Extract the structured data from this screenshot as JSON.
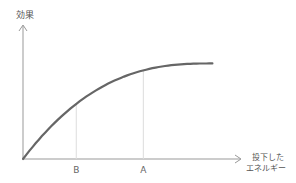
{
  "chart_data": {
    "type": "line",
    "title": "",
    "ylabel": "効果",
    "xlabel_lines": [
      "投下した",
      "エネルギー"
    ],
    "markers": [
      {
        "label": "B",
        "x": 0.27
      },
      {
        "label": "A",
        "x": 0.61
      }
    ],
    "curve": {
      "description": "diminishing returns (concave, saturating)",
      "points": [
        [
          0,
          0
        ],
        [
          0.05,
          0.3
        ],
        [
          0.15,
          0.55
        ],
        [
          0.27,
          0.72
        ],
        [
          0.45,
          0.85
        ],
        [
          0.61,
          0.92
        ],
        [
          0.8,
          0.96
        ],
        [
          0.96,
          0.97
        ]
      ]
    },
    "xlim": [
      0,
      1.1
    ],
    "ylim": [
      0,
      1.35
    ],
    "colors": {
      "curve": "#666666",
      "axis": "#999999",
      "guide": "#dddddd"
    }
  }
}
